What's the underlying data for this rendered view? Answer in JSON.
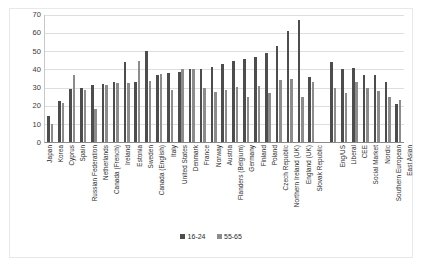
{
  "chart_data": {
    "type": "bar",
    "title": "",
    "subtitle": "",
    "xlabel": "",
    "ylabel": "",
    "ylim": [
      0,
      70
    ],
    "ytick_step": 10,
    "yticks": [
      70,
      60,
      50,
      40,
      30,
      20,
      10,
      0
    ],
    "grid": true,
    "legend_position": "bottom",
    "orientation": "vertical",
    "categories": [
      "Japan",
      "Korea",
      "Cyprus",
      "Spain",
      "Russian Federation",
      "Netherlands",
      "Canada (French)",
      "Ireland",
      "Estonia",
      "Sweden",
      "Canada (English)",
      "Italy",
      "United States",
      "Denmark",
      "France",
      "Norway",
      "Austria",
      "Flanders (Belgium)",
      "Germany",
      "Finland",
      "Poland",
      "Czech Republic",
      "Northern Ireland (UK)",
      "England (UK)",
      "Slovak Republic",
      "",
      "Eng/US",
      "Liberal",
      "CEE",
      "Social Market",
      "Nordic",
      "Southern European",
      "East Asian"
    ],
    "series": [
      {
        "name": "16-24",
        "color": "#4d4d4d",
        "values": [
          14.5,
          22.5,
          29,
          29.5,
          31.5,
          32,
          33,
          44,
          33,
          50,
          37,
          38,
          38.5,
          40,
          40,
          41.5,
          43,
          44.5,
          46,
          47,
          49,
          53,
          61,
          67,
          36,
          null,
          44,
          40,
          41,
          37,
          37,
          33,
          21
        ]
      },
      {
        "name": "55-65",
        "color": "#8c8c8c",
        "values": [
          10,
          21.5,
          37,
          28.5,
          18,
          31.5,
          32.5,
          32.5,
          44.5,
          33.5,
          37.5,
          28.5,
          40,
          40.5,
          30,
          27.5,
          28.5,
          30.5,
          25,
          31,
          27,
          34,
          35,
          25,
          33,
          null,
          30,
          27,
          33,
          29.5,
          28,
          25,
          23
        ]
      }
    ],
    "legend": [
      {
        "label": "16-24",
        "color": "#4d4d4d"
      },
      {
        "label": "55-65",
        "color": "#8c8c8c"
      }
    ]
  }
}
